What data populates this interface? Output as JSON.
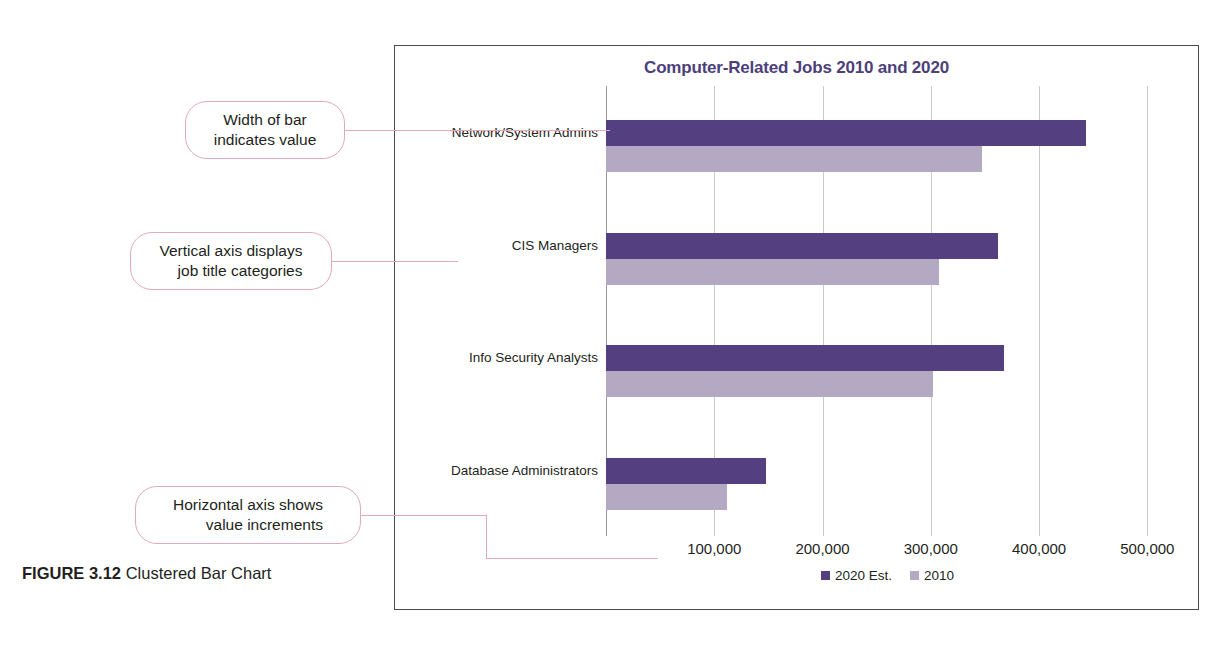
{
  "figure": {
    "label": "FIGURE 3.12",
    "caption": "Clustered Bar Chart"
  },
  "colors": {
    "series_2020": "#544080",
    "series_2010": "#b3a9c3",
    "title": "#4c3f7a",
    "callout_border": "#e2a9b8",
    "frame": "#4a4a4a",
    "gridline": "#c9c9cf"
  },
  "callouts": [
    {
      "id": "width-of-bar",
      "line1": "Width of bar",
      "line2": "indicates value"
    },
    {
      "id": "vertical-axis",
      "line1": "Vertical axis displays",
      "line2": "job title categories"
    },
    {
      "id": "horizontal-axis",
      "line1": "Horizontal axis shows",
      "line2": "value increments"
    }
  ],
  "chart_data": {
    "type": "bar",
    "orientation": "horizontal",
    "title": "Computer-Related Jobs 2010 and 2020",
    "xlabel": "",
    "ylabel": "",
    "categories": [
      "Network/System Admins",
      "CIS Managers",
      "Info Security Analysts",
      "Database Administrators"
    ],
    "series": [
      {
        "name": "2020 Est.",
        "color": "#544080",
        "values": [
          443000,
          362000,
          368000,
          148000
        ]
      },
      {
        "name": "2010",
        "color": "#b3a9c3",
        "values": [
          347000,
          308000,
          302000,
          112000
        ]
      }
    ],
    "xlim": [
      0,
      520000
    ],
    "xticks": [
      0,
      100000,
      200000,
      300000,
      400000,
      500000
    ],
    "xtick_labels": [
      "",
      "100,000",
      "200,000",
      "300,000",
      "400,000",
      "500,000"
    ],
    "grid": true,
    "legend_position": "bottom"
  }
}
